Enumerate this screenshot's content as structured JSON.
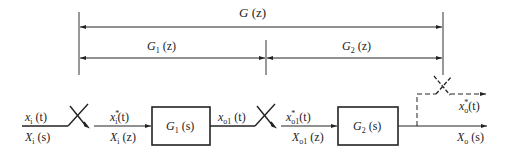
{
  "diagram": {
    "type": "sampled-data block diagram",
    "brackets": {
      "overall": {
        "label": "G (z)",
        "G": "G",
        "arg": " (z)"
      },
      "left": {
        "label": "G1 (z)",
        "G": "G",
        "sub": "1",
        "arg": " (z)"
      },
      "right": {
        "label": "G2 (z)",
        "G": "G",
        "sub": "2",
        "arg": " (z)"
      }
    },
    "blocks": [
      {
        "id": "G1",
        "label": "G1 (s)",
        "G": "G",
        "sub": "1",
        "arg": " (s)"
      },
      {
        "id": "G2",
        "label": "G2 (s)",
        "G": "G",
        "sub": "2",
        "arg": " (s)"
      }
    ],
    "signals": {
      "input_time": {
        "label": "xi (t)",
        "base": "x",
        "sub": "i",
        "arg": " (t)"
      },
      "input_s": {
        "label": "Xi (s)",
        "base": "X",
        "sub": "i",
        "arg": " (s)"
      },
      "sampled_input_time": {
        "label": "xi* (t)",
        "base": "x",
        "sup": "*",
        "sub": "i",
        "arg": "(t)"
      },
      "sampled_input_z": {
        "label": "Xi (z)",
        "base": "X",
        "sub": "i",
        "arg": " (z)"
      },
      "intermediate_time": {
        "label": "xo1 (t)",
        "base": "x",
        "sub": "o1",
        "arg": " (t)"
      },
      "sampled_intermediate_time": {
        "label": "xo1* (t)",
        "base": "x",
        "sup": "*",
        "sub": "o1",
        "arg": "(t)"
      },
      "sampled_intermediate_z": {
        "label": "Xo1 (z)",
        "base": "X",
        "sub": "o1",
        "arg": " (z)"
      },
      "output_sampled_time": {
        "label": "xo* (t)",
        "base": "x",
        "sup": "*",
        "sub": "o",
        "arg": "(t)"
      },
      "output_s": {
        "label": "Xo (s)",
        "base": "X",
        "sub": "o",
        "arg": " (s)"
      }
    },
    "samplers": [
      "input-sampler",
      "intermediate-sampler",
      "output-sampler (dashed, fictitious)"
    ],
    "colors": {
      "stroke": "#222222",
      "background": "#ffffff"
    }
  }
}
